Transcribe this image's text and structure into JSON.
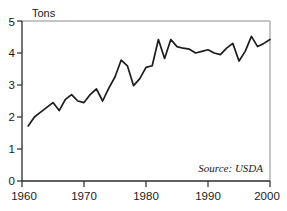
{
  "chart_data": {
    "type": "line",
    "title": "",
    "subtitle": "",
    "xlabel": "",
    "ylabel": "Tons",
    "ylabel_position": "top-left",
    "xlim": [
      1960,
      2000
    ],
    "ylim": [
      0,
      5
    ],
    "yticks": [
      0,
      1,
      2,
      3,
      4,
      5
    ],
    "ytick_labels": [
      "0",
      "1",
      "2",
      "3",
      "4",
      "5"
    ],
    "xticks": [
      1960,
      1970,
      1980,
      1990,
      2000
    ],
    "xtick_labels": [
      "1960",
      "1970",
      "1980",
      "1990",
      "2000"
    ],
    "grid": false,
    "legend": null,
    "legend_position": "none",
    "line_color": "#1c1c1c",
    "annotations": [
      {
        "text": "Source: USDA",
        "position": "bottom-right-inside-plot",
        "style": "italic"
      }
    ],
    "series": [
      {
        "name": "Tons",
        "x": [
          1961,
          1962,
          1963,
          1964,
          1965,
          1966,
          1967,
          1968,
          1969,
          1970,
          1971,
          1972,
          1973,
          1974,
          1975,
          1976,
          1977,
          1978,
          1979,
          1980,
          1981,
          1982,
          1983,
          1984,
          1985,
          1986,
          1987,
          1988,
          1989,
          1990,
          1991,
          1992,
          1993,
          1994,
          1995,
          1996,
          1997,
          1998,
          1999,
          2000
        ],
        "values": [
          1.72,
          2.0,
          2.15,
          2.3,
          2.45,
          2.2,
          2.55,
          2.7,
          2.5,
          2.45,
          2.7,
          2.88,
          2.5,
          2.9,
          3.25,
          3.78,
          3.6,
          2.98,
          3.2,
          3.55,
          3.6,
          4.42,
          3.83,
          4.42,
          4.2,
          4.15,
          4.12,
          4.0,
          4.05,
          4.1,
          4.0,
          3.95,
          4.15,
          4.3,
          3.75,
          4.05,
          4.52,
          4.2,
          4.3,
          4.42
        ]
      }
    ]
  },
  "axes": {
    "y_axis_unit_label": "Tons",
    "source_note": "Source: USDA"
  }
}
